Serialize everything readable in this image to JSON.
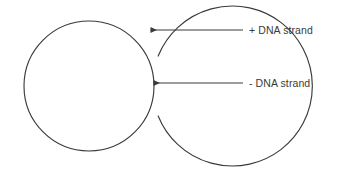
{
  "figure": {
    "title": "",
    "background_color": "#ffffff",
    "stroke_color": "#3a3a3a",
    "text_color": "#3a3a3a",
    "shapes": {
      "outer_arc": {
        "name": "outer-arc-plus-strand",
        "type": "open-arc",
        "center": {
          "cx": 84,
          "cy": 86
        },
        "radius": 80,
        "gap_side": "right",
        "start_angle_deg": 22,
        "end_angle_deg": 338
      },
      "inner_circle": {
        "name": "inner-circle-minus-strand",
        "type": "closed-circle",
        "center": {
          "cx": 89,
          "cy": 86
        },
        "radius": 65
      }
    },
    "annotations": [
      {
        "id": "plus-strand",
        "label": "+ DNA strand",
        "arrow": {
          "tip": {
            "x": 149,
            "y": 30
          },
          "tail": {
            "x": 243,
            "y": 30
          },
          "direction": "left",
          "points_to": "outer-arc-plus-strand"
        }
      },
      {
        "id": "minus-strand",
        "label": "- DNA strand",
        "arrow": {
          "tip": {
            "x": 152,
            "y": 83
          },
          "tail": {
            "x": 243,
            "y": 83
          },
          "direction": "left",
          "points_to": "inner-circle-minus-strand"
        }
      }
    ]
  }
}
